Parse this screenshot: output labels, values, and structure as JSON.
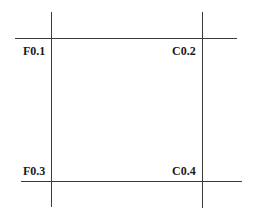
{
  "diagram": {
    "labels": {
      "top_left": "F0.1",
      "top_right": "C0.2",
      "bottom_left": "F0.3",
      "bottom_right": "C0.4"
    }
  }
}
